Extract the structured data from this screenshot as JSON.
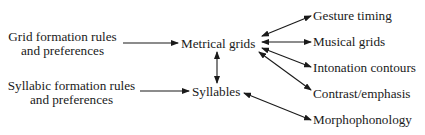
{
  "nodes": {
    "grid_rules": {
      "line1": "Grid formation rules",
      "line2": "and preferences"
    },
    "syllabic_rules": {
      "line1": "Syllabic formation rules",
      "line2": "and preferences"
    },
    "metrical_grids": "Metrical grids",
    "syllables": "Syllables",
    "gesture_timing": "Gesture timing",
    "musical_grids": "Musical grids",
    "intonation_contours": "Intonation contours",
    "contrast_emphasis": "Contrast/emphasis",
    "morphophonology": "Morphophonology"
  },
  "edges": [
    {
      "from": "grid_rules",
      "to": "metrical_grids",
      "type": "one-way"
    },
    {
      "from": "syllabic_rules",
      "to": "syllables",
      "type": "one-way"
    },
    {
      "from": "metrical_grids",
      "to": "syllables",
      "type": "two-way"
    },
    {
      "from": "metrical_grids",
      "to": "gesture_timing",
      "type": "two-way"
    },
    {
      "from": "metrical_grids",
      "to": "musical_grids",
      "type": "two-way"
    },
    {
      "from": "metrical_grids",
      "to": "intonation_contours",
      "type": "two-way"
    },
    {
      "from": "metrical_grids",
      "to": "contrast_emphasis",
      "type": "two-way"
    },
    {
      "from": "syllables",
      "to": "morphophonology",
      "type": "two-way"
    }
  ]
}
